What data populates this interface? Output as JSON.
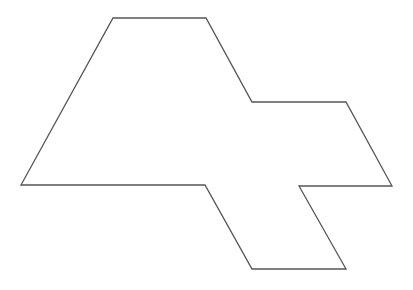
{
  "diagram": {
    "type": "polygon",
    "stroke_color": "#555555",
    "fill_color": "#ffffff",
    "background_color": "#ffffff",
    "stroke_width": 1.3,
    "vertices": [
      [
        113,
        18
      ],
      [
        206,
        18
      ],
      [
        252,
        102
      ],
      [
        346,
        102
      ],
      [
        392,
        186
      ],
      [
        299,
        186
      ],
      [
        346,
        269
      ],
      [
        252,
        269
      ],
      [
        205,
        185
      ],
      [
        21,
        185
      ]
    ]
  }
}
